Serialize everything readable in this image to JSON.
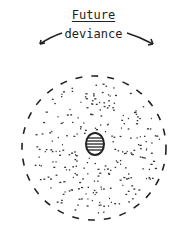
{
  "diagram": {
    "title": "Future",
    "subtitle": "deviance",
    "arrows": [
      "left-arrow",
      "right-arrow"
    ],
    "outer_shape": "dashed-circle",
    "fill": "scattered-dots",
    "center_shape": "striped-oval"
  }
}
